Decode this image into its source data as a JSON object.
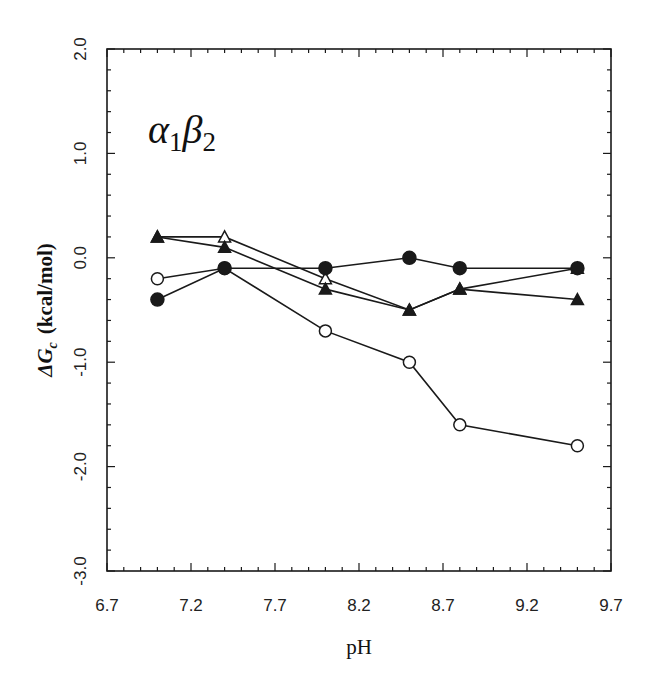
{
  "chart_data": {
    "type": "line",
    "title": "",
    "annotation": "α1β2",
    "xlabel": "pH",
    "ylabel": "ΔGc (kcal/mol)",
    "xlim": [
      6.7,
      9.7
    ],
    "ylim": [
      -3.0,
      2.0
    ],
    "xticks": [
      6.7,
      7.2,
      7.7,
      8.2,
      8.7,
      9.2,
      9.7
    ],
    "xtick_labels": [
      "6.7",
      "7.2",
      "7.7",
      "8.2",
      "8.7",
      "9.2",
      "9.7"
    ],
    "yticks": [
      2.0,
      1.0,
      0.0,
      -1.0,
      -2.0,
      -3.0
    ],
    "ytick_labels": [
      "2.0",
      "1.0",
      "0.0",
      "-1.0",
      "-2.0",
      "-3.0"
    ],
    "x_minor_step": 0.1,
    "y_minor_step": 0.2,
    "grid": false,
    "legend": null,
    "x": [
      7.0,
      7.4,
      8.0,
      8.5,
      8.8,
      9.5
    ],
    "series": [
      {
        "name": "open triangles",
        "marker": "triangle-open",
        "values": [
          0.2,
          0.2,
          -0.2,
          -0.5,
          -0.3,
          -0.1
        ]
      },
      {
        "name": "filled triangles",
        "marker": "triangle-filled",
        "values": [
          0.2,
          0.1,
          -0.3,
          -0.5,
          -0.3,
          -0.4
        ]
      },
      {
        "name": "open circles",
        "marker": "circle-open",
        "values": [
          -0.2,
          -0.1,
          -0.7,
          -1.0,
          -1.6,
          -1.8
        ]
      },
      {
        "name": "filled circles",
        "marker": "circle-filled",
        "values": [
          -0.4,
          -0.1,
          -0.1,
          0.0,
          -0.1,
          -0.1
        ]
      }
    ]
  },
  "labels": {
    "annotation_main1": "α",
    "annotation_sub1": "1",
    "annotation_main2": "β",
    "annotation_sub2": "2",
    "ylabel_delta": "ΔG",
    "ylabel_sub": "c",
    "ylabel_units": "(kcal/mol)",
    "xlabel": "pH"
  },
  "colors": {
    "ink": "#1a1a1a",
    "background": "#ffffff"
  }
}
